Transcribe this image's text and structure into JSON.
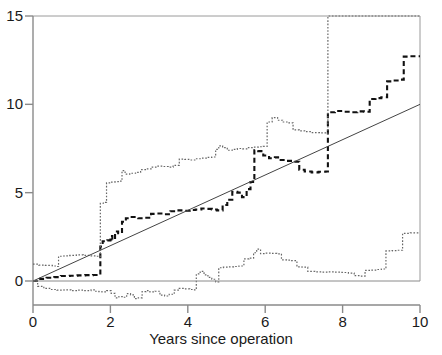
{
  "chart_data": {
    "type": "line",
    "title": "",
    "subtitle": "",
    "xlabel": "Years since operation",
    "ylabel": "",
    "xlim": [
      0,
      10
    ],
    "ylim": [
      0,
      15
    ],
    "grid": false,
    "legend": "none",
    "xticks": [
      0,
      2,
      4,
      6,
      8,
      10
    ],
    "xtick_labels": [
      "0",
      "2",
      "4",
      "6",
      "8",
      "10"
    ],
    "yticks": [
      0,
      5,
      10,
      15
    ],
    "ytick_labels": [
      "0",
      "5",
      "10",
      "15"
    ],
    "annotations": [],
    "series": [
      {
        "name": "estimate",
        "style": "dashed-step",
        "color": "#111111",
        "points": [
          [
            0.0,
            0.0
          ],
          [
            0.18,
            0.12
          ],
          [
            0.35,
            0.18
          ],
          [
            0.55,
            0.22
          ],
          [
            0.72,
            0.28
          ],
          [
            0.95,
            0.3
          ],
          [
            1.15,
            0.32
          ],
          [
            1.35,
            0.33
          ],
          [
            1.55,
            0.34
          ],
          [
            1.7,
            0.35
          ],
          [
            1.74,
            1.95
          ],
          [
            1.8,
            2.25
          ],
          [
            1.92,
            2.3
          ],
          [
            2.0,
            2.55
          ],
          [
            2.05,
            2.35
          ],
          [
            2.12,
            2.8
          ],
          [
            2.2,
            2.7
          ],
          [
            2.3,
            3.35
          ],
          [
            2.4,
            3.55
          ],
          [
            2.55,
            3.62
          ],
          [
            2.72,
            3.55
          ],
          [
            2.9,
            3.58
          ],
          [
            3.05,
            3.8
          ],
          [
            3.2,
            3.82
          ],
          [
            3.38,
            3.78
          ],
          [
            3.55,
            3.95
          ],
          [
            3.72,
            4.0
          ],
          [
            3.9,
            3.98
          ],
          [
            4.05,
            4.02
          ],
          [
            4.2,
            4.05
          ],
          [
            4.35,
            4.1
          ],
          [
            4.5,
            4.08
          ],
          [
            4.62,
            4.05
          ],
          [
            4.75,
            4.0
          ],
          [
            4.9,
            4.3
          ],
          [
            5.02,
            4.6
          ],
          [
            5.15,
            5.05
          ],
          [
            5.28,
            5.0
          ],
          [
            5.4,
            4.75
          ],
          [
            5.52,
            5.2
          ],
          [
            5.62,
            5.6
          ],
          [
            5.72,
            7.4
          ],
          [
            5.82,
            7.35
          ],
          [
            5.95,
            7.1
          ],
          [
            6.1,
            6.95
          ],
          [
            6.25,
            7.0
          ],
          [
            6.4,
            6.85
          ],
          [
            6.55,
            6.8
          ],
          [
            6.72,
            6.75
          ],
          [
            6.88,
            6.3
          ],
          [
            7.02,
            6.2
          ],
          [
            7.2,
            6.15
          ],
          [
            7.38,
            6.18
          ],
          [
            7.56,
            6.2
          ],
          [
            7.62,
            9.55
          ],
          [
            7.8,
            9.62
          ],
          [
            8.0,
            9.58
          ],
          [
            8.2,
            9.55
          ],
          [
            8.38,
            9.6
          ],
          [
            8.55,
            9.58
          ],
          [
            8.7,
            10.3
          ],
          [
            8.85,
            10.35
          ],
          [
            9.0,
            10.4
          ],
          [
            9.15,
            11.3
          ],
          [
            9.3,
            11.35
          ],
          [
            9.45,
            11.4
          ],
          [
            9.58,
            12.7
          ],
          [
            9.75,
            12.72
          ],
          [
            10.0,
            12.72
          ]
        ]
      },
      {
        "name": "upper-confidence-band",
        "style": "dotted-step",
        "color": "#666666",
        "points": [
          [
            0.0,
            0.95
          ],
          [
            0.15,
            0.9
          ],
          [
            0.32,
            0.88
          ],
          [
            0.5,
            0.85
          ],
          [
            0.6,
            0.82
          ],
          [
            0.66,
            1.4
          ],
          [
            0.8,
            1.42
          ],
          [
            0.95,
            1.45
          ],
          [
            1.12,
            1.48
          ],
          [
            1.3,
            1.45
          ],
          [
            1.48,
            1.42
          ],
          [
            1.62,
            1.4
          ],
          [
            1.7,
            1.38
          ],
          [
            1.74,
            4.4
          ],
          [
            1.82,
            4.45
          ],
          [
            1.9,
            5.55
          ],
          [
            2.0,
            5.6
          ],
          [
            2.12,
            5.62
          ],
          [
            2.22,
            5.65
          ],
          [
            2.3,
            6.25
          ],
          [
            2.38,
            6.05
          ],
          [
            2.5,
            6.1
          ],
          [
            2.65,
            6.15
          ],
          [
            2.78,
            6.3
          ],
          [
            2.92,
            6.35
          ],
          [
            3.05,
            6.45
          ],
          [
            3.2,
            6.5
          ],
          [
            3.35,
            6.48
          ],
          [
            3.5,
            6.45
          ],
          [
            3.62,
            6.55
          ],
          [
            3.78,
            6.9
          ],
          [
            3.92,
            6.88
          ],
          [
            4.05,
            6.85
          ],
          [
            4.2,
            6.92
          ],
          [
            4.35,
            6.95
          ],
          [
            4.5,
            7.0
          ],
          [
            4.62,
            7.02
          ],
          [
            4.72,
            7.45
          ],
          [
            4.8,
            7.65
          ],
          [
            4.9,
            7.55
          ],
          [
            5.02,
            7.4
          ],
          [
            5.15,
            7.45
          ],
          [
            5.28,
            7.5
          ],
          [
            5.42,
            7.48
          ],
          [
            5.55,
            7.55
          ],
          [
            5.7,
            7.58
          ],
          [
            5.82,
            7.6
          ],
          [
            5.95,
            7.62
          ],
          [
            6.05,
            9.0
          ],
          [
            6.18,
            9.25
          ],
          [
            6.32,
            9.1
          ],
          [
            6.45,
            9.0
          ],
          [
            6.58,
            8.95
          ],
          [
            6.72,
            8.55
          ],
          [
            6.88,
            8.5
          ],
          [
            7.02,
            8.45
          ],
          [
            7.2,
            8.4
          ],
          [
            7.4,
            8.38
          ],
          [
            7.58,
            8.35
          ],
          [
            7.62,
            15.0
          ],
          [
            7.8,
            15.0
          ],
          [
            8.0,
            15.0
          ],
          [
            8.5,
            15.0
          ],
          [
            9.0,
            15.0
          ],
          [
            9.5,
            15.0
          ],
          [
            10.0,
            15.0
          ]
        ]
      },
      {
        "name": "lower-confidence-band",
        "style": "dotted-step",
        "color": "#666666",
        "points": [
          [
            0.0,
            0.0
          ],
          [
            0.12,
            -0.3
          ],
          [
            0.28,
            -0.42
          ],
          [
            0.45,
            -0.48
          ],
          [
            0.62,
            -0.52
          ],
          [
            0.8,
            -0.5
          ],
          [
            0.98,
            -0.55
          ],
          [
            1.15,
            -0.52
          ],
          [
            1.32,
            -0.55
          ],
          [
            1.5,
            -0.5
          ],
          [
            1.62,
            -0.58
          ],
          [
            1.7,
            -0.6
          ],
          [
            1.78,
            -0.62
          ],
          [
            1.9,
            -0.55
          ],
          [
            2.02,
            -0.7
          ],
          [
            2.12,
            -0.95
          ],
          [
            2.22,
            -0.88
          ],
          [
            2.32,
            -0.92
          ],
          [
            2.42,
            -0.72
          ],
          [
            2.52,
            -0.78
          ],
          [
            2.62,
            -1.0
          ],
          [
            2.72,
            -0.95
          ],
          [
            2.82,
            -0.6
          ],
          [
            2.92,
            -0.55
          ],
          [
            3.02,
            -0.62
          ],
          [
            3.15,
            -0.58
          ],
          [
            3.28,
            -0.8
          ],
          [
            3.4,
            -0.85
          ],
          [
            3.52,
            -0.75
          ],
          [
            3.65,
            -0.52
          ],
          [
            3.78,
            -0.42
          ],
          [
            3.92,
            -0.45
          ],
          [
            4.05,
            -0.48
          ],
          [
            4.15,
            -0.5
          ],
          [
            4.22,
            0.4
          ],
          [
            4.32,
            0.55
          ],
          [
            4.42,
            0.35
          ],
          [
            4.52,
            0.2
          ],
          [
            4.62,
            0.1
          ],
          [
            4.72,
            -0.05
          ],
          [
            4.8,
            0.75
          ],
          [
            4.92,
            0.78
          ],
          [
            5.05,
            0.8
          ],
          [
            5.18,
            0.82
          ],
          [
            5.32,
            0.85
          ],
          [
            5.45,
            1.25
          ],
          [
            5.58,
            1.3
          ],
          [
            5.7,
            1.6
          ],
          [
            5.78,
            1.8
          ],
          [
            5.88,
            1.55
          ],
          [
            6.0,
            1.58
          ],
          [
            6.15,
            1.56
          ],
          [
            6.3,
            1.54
          ],
          [
            6.42,
            1.2
          ],
          [
            6.55,
            1.18
          ],
          [
            6.68,
            1.15
          ],
          [
            6.82,
            0.8
          ],
          [
            6.95,
            0.78
          ],
          [
            7.1,
            0.55
          ],
          [
            7.28,
            0.52
          ],
          [
            7.45,
            0.5
          ],
          [
            7.62,
            0.52
          ],
          [
            7.8,
            0.5
          ],
          [
            7.98,
            0.48
          ],
          [
            8.15,
            0.45
          ],
          [
            8.3,
            0.3
          ],
          [
            8.45,
            0.28
          ],
          [
            8.58,
            0.6
          ],
          [
            8.72,
            0.62
          ],
          [
            8.88,
            0.65
          ],
          [
            9.0,
            0.68
          ],
          [
            9.12,
            1.7
          ],
          [
            9.28,
            1.72
          ],
          [
            9.42,
            1.74
          ],
          [
            9.55,
            2.7
          ],
          [
            9.75,
            2.72
          ],
          [
            10.0,
            2.72
          ]
        ]
      },
      {
        "name": "reference-line",
        "style": "solid",
        "color": "#444444",
        "points": [
          [
            0.0,
            0.0
          ],
          [
            10.0,
            10.0
          ]
        ]
      },
      {
        "name": "zero-baseline",
        "style": "solid",
        "color": "#8a8a8a",
        "points": [
          [
            0.0,
            0.0
          ],
          [
            10.0,
            0.0
          ]
        ]
      }
    ]
  },
  "axes": {
    "x_title": "Years since operation",
    "x_tick_labels": [
      "0",
      "2",
      "4",
      "6",
      "8",
      "10"
    ],
    "y_tick_labels": [
      "0",
      "5",
      "10",
      "15"
    ]
  },
  "colors": {
    "axis": "#8a8a8a",
    "estimate": "#111111",
    "band": "#666666",
    "reference": "#444444",
    "background": "#ffffff"
  }
}
